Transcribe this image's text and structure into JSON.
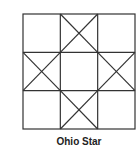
{
  "caption": "Ohio Star",
  "grid": {
    "rows": 3,
    "cols": 3,
    "x": 23,
    "y": 14,
    "width": 112,
    "height": 115,
    "stroke": "#333333"
  },
  "crossed_cells": [
    {
      "row": 0,
      "col": 1
    },
    {
      "row": 1,
      "col": 0
    },
    {
      "row": 1,
      "col": 2
    },
    {
      "row": 2,
      "col": 1
    }
  ]
}
